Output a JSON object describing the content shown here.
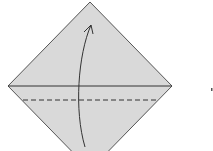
{
  "diagram": {
    "type": "origami-fold-step",
    "paper_color": "#d9d9d9",
    "edge_color": "#555555",
    "line_color": "#333333",
    "instruction": "valley fold bottom corner up along dashed line",
    "marker": "·"
  }
}
